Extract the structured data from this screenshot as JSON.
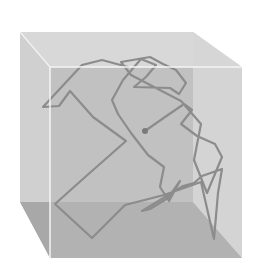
{
  "figure": {
    "colors": {
      "background": "#ffffff",
      "top_face": "#d8d8d8",
      "left_face": "#d0d0d0",
      "back_face": "#bdbdbd",
      "right_face": "#d6d6d6",
      "floor": "#a8a8a8",
      "front_face": "#cfcfcf",
      "edge_highlight": "#f4f4f4",
      "path": "#8c8c8c",
      "start_dot": "#7a7a7a"
    },
    "cube": {
      "back_top_left": [
        20,
        32
      ],
      "back_top_right": [
        193,
        32
      ],
      "back_bottom_left": [
        20,
        202
      ],
      "back_bottom_right": [
        193,
        202
      ],
      "front_top_left": [
        50,
        67
      ],
      "front_top_right": [
        242,
        67
      ],
      "front_bottom_left": [
        50,
        258
      ],
      "front_bottom_right": [
        242,
        258
      ]
    },
    "path_points": "145,131 165,117 184,104 192,110 181,124 197,136 215,144 222,157 207,193 194,160 201,124 181,101 131,75 121,62 150,57 163,64 176,70 186,83 179,94 170,88 134,87 146,77 156,65 141,59 123,80 112,100 118,114 131,133 148,155 164,167 160,187 169,201 180,181 168,198 150,209 142,211 183,186 194,183 202,176 222,169 218,193 214,239 201,182 164,195 125,205 92,238 55,204 84,178 126,141 93,117 70,91 59,106 43,107 82,65 102,60 128,67",
    "start_point": [
      145,
      131
    ]
  }
}
